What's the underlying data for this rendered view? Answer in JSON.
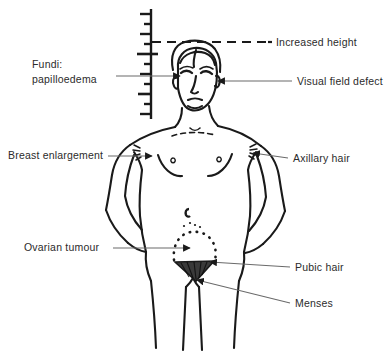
{
  "figure": {
    "background_color": "#ffffff",
    "ink_color": "#1a1a1a",
    "leader_line_color": "#555555"
  },
  "annotations": [
    {
      "id": "fundi",
      "label_line1": "Fundi:",
      "label_line2": "papilloedema",
      "target": "eyes",
      "side": "left"
    },
    {
      "id": "increased-height",
      "label_line1": "Increased height",
      "label_line2": "",
      "target": "top-of-head",
      "side": "right"
    },
    {
      "id": "visual-field-defect",
      "label_line1": "Visual field defect",
      "label_line2": "",
      "target": "eyes",
      "side": "right"
    },
    {
      "id": "breast-enlargement",
      "label_line1": "Breast enlargement",
      "label_line2": "",
      "target": "left-breast",
      "side": "left"
    },
    {
      "id": "axillary-hair",
      "label_line1": "Axillary hair",
      "label_line2": "",
      "target": "right-axilla",
      "side": "right"
    },
    {
      "id": "ovarian-tumour",
      "label_line1": "Ovarian tumour",
      "label_line2": "",
      "target": "lower-abdomen",
      "side": "left"
    },
    {
      "id": "pubic-hair",
      "label_line1": "Pubic hair",
      "label_line2": "",
      "target": "pubic-region",
      "side": "right"
    },
    {
      "id": "menses",
      "label_line1": "Menses",
      "label_line2": "",
      "target": "perineum",
      "side": "right"
    }
  ],
  "measuring_scale": {
    "name": "height-measuring-ruler",
    "tick_count": 11,
    "dashed_height_marker": true
  }
}
